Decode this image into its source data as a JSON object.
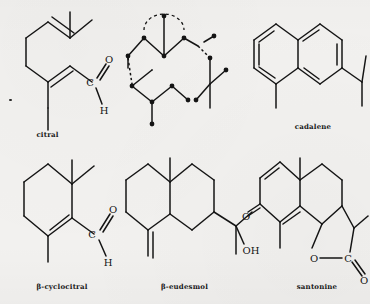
{
  "page": {
    "kind": "chemical-structure-plate",
    "background_color": "#f2f1ef",
    "ink_color": "#141414",
    "width": 370,
    "height": 304,
    "rows": 2,
    "columns": 3
  },
  "structures": [
    {
      "id": "citral",
      "caption": "citral",
      "position": "top-left",
      "skeleton": "open-chain",
      "atom_labels": [
        "C",
        "O",
        "H"
      ],
      "functional_group": "aldehyde",
      "double_bonds": 2,
      "methyl_branches": 3
    },
    {
      "id": "isoprene-units",
      "caption": "",
      "position": "top-center",
      "skeleton": "open-chain-isoprene-units",
      "atom_labels": [],
      "functional_group": "none",
      "double_bonds": 0,
      "methyl_branches": 4,
      "has_dotted_bonds": true,
      "has_dashed_arc": true,
      "vertex_dots": true
    },
    {
      "id": "cadalene",
      "caption": "cadalene",
      "position": "top-right",
      "skeleton": "naphthalene",
      "atom_labels": [],
      "functional_group": "aromatic",
      "double_bonds": 5,
      "methyl_branches": 2,
      "substituents": [
        "methyl",
        "methyl",
        "isopropyl"
      ]
    },
    {
      "id": "beta-cyclocitral",
      "caption": "β-cyclocitral",
      "position": "bottom-left",
      "skeleton": "cyclohexene",
      "atom_labels": [
        "C",
        "O",
        "H"
      ],
      "functional_group": "aldehyde",
      "double_bonds": 2,
      "methyl_branches": 3
    },
    {
      "id": "beta-eudesmol",
      "caption": "β-eudesmol",
      "position": "bottom-center",
      "skeleton": "decalin",
      "atom_labels": [
        "OH"
      ],
      "functional_group": "tertiary alcohol",
      "double_bonds": 1,
      "methyl_branches": 3,
      "substituents": [
        "exocyclic methylene",
        "angular methyl",
        "2-hydroxypropan-2-yl"
      ]
    },
    {
      "id": "santonine",
      "caption": "santonine",
      "position": "bottom-right",
      "skeleton": "fused-bicyclic-with-lactone",
      "atom_labels": [
        "O",
        "O",
        "C",
        "O"
      ],
      "functional_group": "cross-conjugated dienone + γ-lactone",
      "double_bonds": 4,
      "methyl_branches": 3
    }
  ],
  "labels": {
    "citral": "citral",
    "cadalene": "cadalene",
    "beta_cyclocitral": "β-cyclocitral",
    "beta_eudesmol": "β-eudesmol",
    "santonine": "santonine",
    "atom_c": "C",
    "atom_o": "O",
    "atom_h": "H",
    "atom_oh": "OH"
  }
}
